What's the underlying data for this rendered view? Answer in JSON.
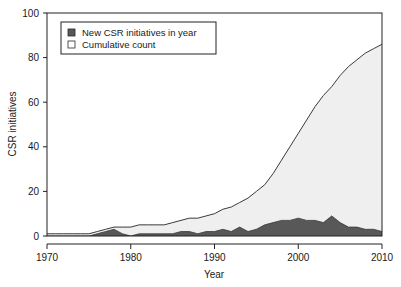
{
  "chart_data": {
    "type": "area",
    "title": "",
    "subtitle": "",
    "xlabel": "Year",
    "ylabel": "CSR initiatives",
    "xlim": [
      1970,
      2010
    ],
    "ylim": [
      0,
      100
    ],
    "xticks": [
      1970,
      1980,
      1990,
      2000,
      2010
    ],
    "xtick_labels": [
      "1970",
      "1980",
      "1990",
      "2000",
      "2010"
    ],
    "yticks": [
      0,
      20,
      40,
      60,
      80,
      100
    ],
    "ytick_labels": [
      "0",
      "20",
      "40",
      "60",
      "80",
      "100"
    ],
    "grid": false,
    "legend_position": "top-left",
    "x": [
      1970,
      1971,
      1972,
      1973,
      1974,
      1975,
      1976,
      1977,
      1978,
      1979,
      1980,
      1981,
      1982,
      1983,
      1984,
      1985,
      1986,
      1987,
      1988,
      1989,
      1990,
      1991,
      1992,
      1993,
      1994,
      1995,
      1996,
      1997,
      1998,
      1999,
      2000,
      2001,
      2002,
      2003,
      2004,
      2005,
      2006,
      2007,
      2008,
      2009,
      2010
    ],
    "series": [
      {
        "name": "Cumulative count",
        "marker": "open-square",
        "fill": "#efefef",
        "line": "#3a3a3a",
        "values": [
          1,
          1,
          1,
          1,
          1,
          1,
          2,
          3,
          4,
          4,
          4,
          5,
          5,
          5,
          5,
          6,
          7,
          8,
          8,
          9,
          10,
          12,
          13,
          15,
          17,
          20,
          23,
          28,
          34,
          40,
          46,
          52,
          58,
          63,
          67,
          72,
          76,
          79,
          82,
          84,
          86
        ]
      },
      {
        "name": "New CSR initiatives in year",
        "marker": "filled-square",
        "fill": "#585858",
        "line": "#3a3a3a",
        "values": [
          0,
          0,
          0,
          0,
          0,
          0,
          1,
          2,
          3,
          1,
          0,
          1,
          1,
          1,
          1,
          1,
          2,
          2,
          1,
          2,
          2,
          3,
          2,
          4,
          2,
          3,
          5,
          6,
          7,
          7,
          8,
          7,
          7,
          6,
          9,
          6,
          4,
          4,
          3,
          3,
          2
        ]
      }
    ],
    "legend": [
      {
        "label": "New CSR initiatives in year",
        "marker": "filled-square",
        "color": "#585858"
      },
      {
        "label": "Cumulative count",
        "marker": "open-square",
        "color": "#ffffff"
      }
    ]
  },
  "colors": {
    "frame": "#222222",
    "cumulative_fill": "#efefef",
    "new_fill": "#585858",
    "line": "#3a3a3a",
    "text": "#1a1a1a",
    "background": "#ffffff"
  }
}
